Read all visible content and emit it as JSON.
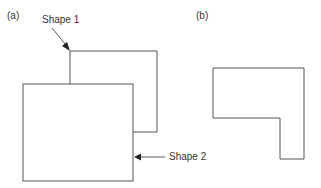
{
  "panels": {
    "a": {
      "label": "(a)"
    },
    "b": {
      "label": "(b)"
    }
  },
  "annotations": {
    "shape1": "Shape 1",
    "shape2": "Shape 2"
  },
  "colors": {
    "stroke": "#555555",
    "arrow": "#222222",
    "text": "#333333"
  }
}
